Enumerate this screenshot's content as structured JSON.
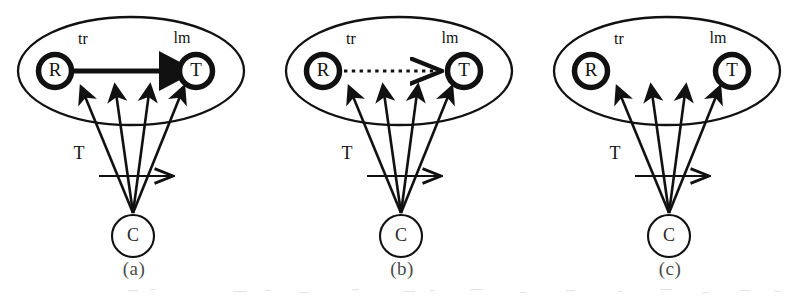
{
  "figure": {
    "background_color": "#ffffff",
    "ink_color": "#111111",
    "panel_count": 3,
    "width": 804,
    "height": 302
  },
  "labels": {
    "source_node": "R",
    "target_node": "T",
    "context_node": "C",
    "source_edge_label": "tr",
    "target_edge_label": "lm",
    "flow_label": "T"
  },
  "panels": [
    {
      "id": "panel-a",
      "caption": "(a)",
      "relation_style": "solid-thick",
      "relation_present": true,
      "nodes": {
        "left": "R",
        "right": "T",
        "bottom": "C"
      },
      "node_labels": {
        "left_top": "tr",
        "right_top": "lm"
      },
      "fan_arrow_count": 4,
      "flow_arrow_label": "T"
    },
    {
      "id": "panel-b",
      "caption": "(b)",
      "relation_style": "dotted-thin",
      "relation_present": true,
      "nodes": {
        "left": "R",
        "right": "T",
        "bottom": "C"
      },
      "node_labels": {
        "left_top": "tr",
        "right_top": "lm"
      },
      "fan_arrow_count": 4,
      "flow_arrow_label": "T"
    },
    {
      "id": "panel-c",
      "caption": "(c)",
      "relation_style": "none",
      "relation_present": false,
      "nodes": {
        "left": "R",
        "right": "T",
        "bottom": "C"
      },
      "node_labels": {
        "left_top": "tr",
        "right_top": "lm"
      },
      "fan_arrow_count": 4,
      "flow_arrow_label": "T"
    }
  ]
}
